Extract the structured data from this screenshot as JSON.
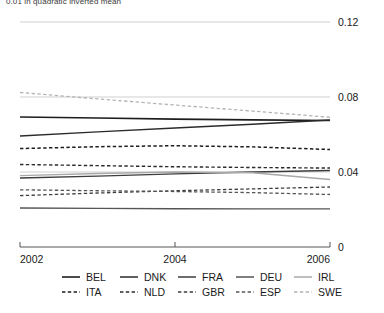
{
  "caption": {
    "text": "0.01 in quadratic inverted mean"
  },
  "chart_data": {
    "type": "line",
    "title": "",
    "xlabel": "",
    "ylabel": "",
    "x": [
      2002,
      2003,
      2004,
      2005,
      2006
    ],
    "xlim": [
      2002,
      2006
    ],
    "ylim": [
      0,
      0.12
    ],
    "xticks": [
      2002,
      2004,
      2006
    ],
    "xtick_labels": [
      "2002",
      "2004",
      "2006"
    ],
    "yticks": [
      0,
      0.04,
      0.08,
      0.12
    ],
    "ytick_labels": [
      "0",
      "0.04",
      "0.08",
      "0.12"
    ],
    "y_axis_position": "right",
    "grid": true,
    "grid_axis": "y",
    "legend_position": "bottom",
    "legend_columns": 5,
    "series": [
      {
        "name": "BEL",
        "style": "solid",
        "color": "#1d1d1d",
        "width": 1.6,
        "values": [
          0.0693,
          0.0688,
          0.0682,
          0.0678,
          0.0675
        ]
      },
      {
        "name": "DNK",
        "style": "solid",
        "color": "#2b2b2b",
        "width": 1.5,
        "values": [
          0.0592,
          0.0614,
          0.0635,
          0.0655,
          0.0677
        ]
      },
      {
        "name": "FRA",
        "style": "solid",
        "color": "#3d3d3d",
        "width": 1.4,
        "values": [
          0.0368,
          0.0378,
          0.039,
          0.04,
          0.0408
        ]
      },
      {
        "name": "DEU",
        "style": "solid",
        "color": "#555555",
        "width": 1.3,
        "values": [
          0.0208,
          0.0206,
          0.0204,
          0.0203,
          0.0203
        ]
      },
      {
        "name": "IRL",
        "style": "solid",
        "color": "#a8a8a8",
        "width": 1.3,
        "values": [
          0.0381,
          0.0392,
          0.04,
          0.0396,
          0.036
        ]
      },
      {
        "name": "ITA",
        "style": "dashed",
        "color": "#1d1d1d",
        "width": 1.5,
        "values": [
          0.0525,
          0.0535,
          0.054,
          0.0534,
          0.052
        ]
      },
      {
        "name": "NLD",
        "style": "dashed",
        "color": "#2b2b2b",
        "width": 1.4,
        "values": [
          0.044,
          0.0434,
          0.0428,
          0.0424,
          0.0421
        ]
      },
      {
        "name": "GBR",
        "style": "dashed",
        "color": "#3d3d3d",
        "width": 1.3,
        "values": [
          0.0274,
          0.0288,
          0.03,
          0.031,
          0.032
        ]
      },
      {
        "name": "ESP",
        "style": "dashed",
        "color": "#555555",
        "width": 1.3,
        "values": [
          0.0305,
          0.03,
          0.0296,
          0.029,
          0.028
        ]
      },
      {
        "name": "SWE",
        "style": "dashed",
        "color": "#b4b4b4",
        "width": 1.3,
        "values": [
          0.0824,
          0.079,
          0.0757,
          0.0725,
          0.0692
        ]
      }
    ]
  },
  "axis": {
    "line_color": "#555555",
    "grid_color": "#c9c9c9"
  }
}
